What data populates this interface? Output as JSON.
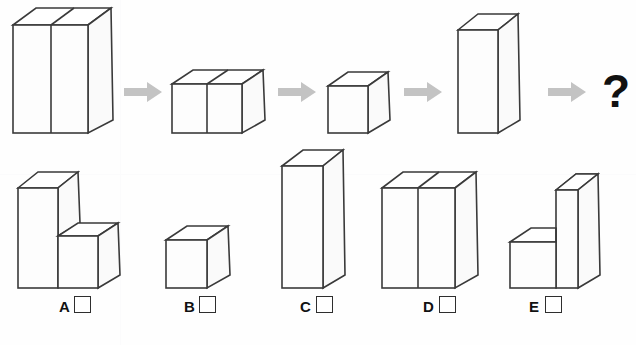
{
  "puzzle": {
    "type": "visual-reasoning-sequence",
    "top_partial_text": "",
    "question_mark": "?",
    "sequence": [
      {
        "id": "seq-1",
        "name": "two-tall-blocks",
        "blocks": 2,
        "height": "tall",
        "label": ""
      },
      {
        "id": "seq-2",
        "name": "two-short-blocks",
        "blocks": 2,
        "height": "short",
        "label": ""
      },
      {
        "id": "seq-3",
        "name": "one-cube",
        "blocks": 1,
        "height": "short",
        "label": ""
      },
      {
        "id": "seq-4",
        "name": "one-tall-block",
        "blocks": 1,
        "height": "tall",
        "label": ""
      }
    ],
    "arrows": [
      {
        "id": "arrow-1"
      },
      {
        "id": "arrow-2"
      },
      {
        "id": "arrow-3"
      },
      {
        "id": "arrow-4"
      }
    ],
    "options": [
      {
        "letter": "A",
        "name": "tall-left-short-right",
        "checked": false
      },
      {
        "letter": "B",
        "name": "single-cube",
        "checked": false
      },
      {
        "letter": "C",
        "name": "single-very-tall-block",
        "checked": false
      },
      {
        "letter": "D",
        "name": "two-tall-blocks",
        "checked": false
      },
      {
        "letter": "E",
        "name": "short-left-tall-right",
        "checked": false
      }
    ]
  },
  "colors": {
    "stroke": "#3a3a3a",
    "face": "#fdfdfd",
    "arrow": "#c3c3c3",
    "text": "#111111",
    "background": "#fefefe"
  }
}
